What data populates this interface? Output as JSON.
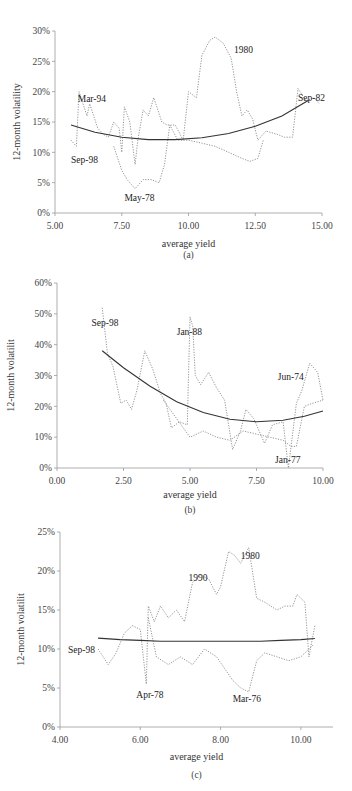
{
  "chart_data": [
    {
      "id": "a",
      "type": "line",
      "caption": "(a)",
      "title": "",
      "xlabel": "average yield",
      "ylabel": "12-month volatility",
      "xlim": [
        5.0,
        15.0
      ],
      "ylim": [
        0,
        30
      ],
      "xticks": [
        "5.00",
        "7.50",
        "10.00",
        "12.50",
        "15.00"
      ],
      "yticks": [
        "0%",
        "5%",
        "10%",
        "15%",
        "20%",
        "25%",
        "30%"
      ],
      "grid": false,
      "legend": null,
      "annotations": [
        {
          "text": "Mar-94",
          "x": 5.85,
          "y": 18.3
        },
        {
          "text": "Sep-98",
          "x": 5.6,
          "y": 8.2
        },
        {
          "text": "May-78",
          "x": 7.6,
          "y": 2.0
        },
        {
          "text": "1980",
          "x": 11.7,
          "y": 26.3
        },
        {
          "text": "Sep-82",
          "x": 14.1,
          "y": 18.5
        }
      ],
      "fitted_curve": {
        "name": "quadratic fit",
        "x": [
          5.6,
          6.5,
          7.5,
          8.5,
          9.5,
          10.5,
          11.5,
          12.5,
          13.5,
          14.5
        ],
        "y": [
          14.5,
          13.3,
          12.5,
          12.1,
          12.1,
          12.4,
          13.1,
          14.3,
          16.0,
          18.6
        ]
      },
      "series": [
        {
          "name": "observed (dotted path)",
          "x": [
            5.6,
            5.8,
            5.9,
            6.2,
            6.3,
            6.6,
            6.8,
            7.0,
            7.2,
            7.4,
            7.5,
            7.6,
            7.8,
            8.0,
            8.1,
            8.3,
            8.5,
            8.7,
            9.0,
            9.2,
            9.5,
            9.8,
            10.0,
            10.3,
            10.5,
            10.8,
            11.0,
            11.3,
            11.6,
            11.8,
            12.0,
            12.2,
            12.4,
            12.6,
            12.9,
            13.3,
            13.6,
            13.9,
            14.1,
            14.4,
            14.7,
            14.9
          ],
          "y": [
            12.0,
            11.0,
            20.0,
            16.0,
            18.0,
            14.0,
            13.0,
            12.5,
            15.0,
            14.0,
            10.0,
            17.5,
            15.0,
            8.0,
            12.0,
            17.0,
            16.0,
            19.0,
            15.0,
            14.5,
            14.5,
            12.0,
            20.0,
            19.0,
            26.0,
            28.5,
            29.0,
            28.0,
            25.5,
            20.0,
            16.0,
            17.0,
            15.5,
            12.0,
            13.5,
            13.0,
            12.5,
            12.5,
            20.5,
            18.5,
            19.0,
            18.0
          ]
        },
        {
          "name": "observed (dotted path 2)",
          "x": [
            7.2,
            7.5,
            7.7,
            8.0,
            8.3,
            8.6,
            8.9,
            9.1,
            9.3,
            9.6,
            10.0,
            10.5,
            11.0,
            11.5,
            12.0,
            12.3,
            12.6,
            12.8
          ],
          "y": [
            11.0,
            7.0,
            5.5,
            4.0,
            5.5,
            5.5,
            5.0,
            8.0,
            14.5,
            12.0,
            12.0,
            11.5,
            11.0,
            10.0,
            9.0,
            8.5,
            9.0,
            12.0
          ]
        }
      ]
    },
    {
      "id": "b",
      "type": "line",
      "caption": "(b)",
      "title": "",
      "xlabel": "average yield",
      "ylabel": "12-month volatilit",
      "xlim": [
        0.0,
        10.0
      ],
      "ylim": [
        0,
        60
      ],
      "xticks": [
        "0.00",
        "2.50",
        "5.00",
        "7.50",
        "10.00"
      ],
      "yticks": [
        "0%",
        "10%",
        "20%",
        "30%",
        "40%",
        "50%",
        "60%"
      ],
      "grid": false,
      "legend": null,
      "annotations": [
        {
          "text": "Sep-98",
          "x": 1.3,
          "y": 46.0
        },
        {
          "text": "Jan-88",
          "x": 4.5,
          "y": 43.0
        },
        {
          "text": "Jun-74",
          "x": 8.3,
          "y": 28.5
        },
        {
          "text": "Jan-77",
          "x": 8.2,
          "y": 1.5
        }
      ],
      "fitted_curve": {
        "name": "quadratic fit",
        "x": [
          1.7,
          2.5,
          3.5,
          4.5,
          5.5,
          6.5,
          7.5,
          8.5,
          9.3,
          10.0
        ],
        "y": [
          38.0,
          32.5,
          26.5,
          21.5,
          18.0,
          15.8,
          15.0,
          15.5,
          16.8,
          18.5
        ]
      },
      "series": [
        {
          "name": "observed (dotted path)",
          "x": [
            1.7,
            1.9,
            2.1,
            2.4,
            2.6,
            2.8,
            3.0,
            3.3,
            3.6,
            3.9,
            4.1,
            4.3,
            4.6,
            4.9,
            5.0,
            5.1,
            5.2,
            5.4,
            5.7,
            6.0,
            6.3,
            6.6,
            6.9,
            7.1,
            7.4,
            7.8,
            8.1,
            8.5,
            8.7,
            9.0,
            9.2,
            9.5,
            9.8,
            10.0
          ],
          "y": [
            52.0,
            37.0,
            33.0,
            21.0,
            22.0,
            19.0,
            25.0,
            38.0,
            32.0,
            24.0,
            21.0,
            13.0,
            15.0,
            14.0,
            49.0,
            46.0,
            30.0,
            27.0,
            31.0,
            26.0,
            22.0,
            6.0,
            12.0,
            19.0,
            16.0,
            8.0,
            14.0,
            15.0,
            0.0,
            21.0,
            25.0,
            34.0,
            31.0,
            22.0
          ]
        },
        {
          "name": "observed (dotted path 2)",
          "x": [
            4.0,
            4.5,
            5.0,
            5.5,
            6.0,
            6.5,
            7.0,
            7.5,
            8.0,
            8.5,
            8.8,
            9.0,
            9.3,
            9.6,
            10.0
          ],
          "y": [
            22.0,
            16.0,
            10.0,
            12.0,
            10.0,
            9.0,
            12.0,
            11.0,
            10.0,
            9.0,
            7.0,
            7.0,
            20.0,
            21.0,
            22.0
          ]
        }
      ]
    },
    {
      "id": "c",
      "type": "line",
      "caption": "(c)",
      "title": "",
      "xlabel": "average yield",
      "ylabel": "12-month volatilit",
      "xlim": [
        4.0,
        10.8
      ],
      "ylim": [
        0,
        25
      ],
      "xticks": [
        "4.00",
        "6.00",
        "8.00",
        "10.00"
      ],
      "yticks": [
        "0%",
        "5%",
        "10%",
        "15%",
        "20%",
        "25%"
      ],
      "grid": false,
      "legend": null,
      "annotations": [
        {
          "text": "Sep-98",
          "x": 4.2,
          "y": 9.5
        },
        {
          "text": "Apr-78",
          "x": 5.9,
          "y": 3.7
        },
        {
          "text": "1990",
          "x": 7.2,
          "y": 18.7
        },
        {
          "text": "1980",
          "x": 8.5,
          "y": 21.5
        },
        {
          "text": "Mar-76",
          "x": 8.3,
          "y": 3.2
        }
      ],
      "fitted_curve": {
        "name": "quadratic fit",
        "x": [
          4.95,
          5.5,
          6.0,
          6.5,
          7.0,
          7.5,
          8.0,
          8.5,
          9.0,
          9.5,
          10.0,
          10.35
        ],
        "y": [
          11.4,
          11.2,
          11.1,
          11.0,
          11.0,
          11.0,
          11.0,
          11.0,
          11.0,
          11.1,
          11.2,
          11.35
        ]
      },
      "series": [
        {
          "name": "observed (dotted path)",
          "x": [
            4.95,
            5.2,
            5.4,
            5.6,
            5.8,
            6.0,
            6.15,
            6.2,
            6.35,
            6.5,
            6.7,
            6.9,
            7.1,
            7.3,
            7.5,
            7.7,
            7.9,
            8.0,
            8.2,
            8.35,
            8.5,
            8.7,
            8.9,
            9.1,
            9.4,
            9.6,
            9.8,
            9.9,
            10.1,
            10.2,
            10.35
          ],
          "y": [
            10.0,
            8.0,
            9.5,
            12.0,
            13.0,
            12.5,
            5.5,
            15.5,
            13.5,
            15.5,
            14.0,
            15.0,
            13.5,
            18.5,
            19.5,
            19.0,
            17.0,
            18.0,
            22.5,
            22.0,
            21.0,
            23.0,
            16.5,
            16.0,
            15.0,
            15.5,
            15.5,
            17.0,
            16.0,
            9.0,
            13.0
          ]
        },
        {
          "name": "observed (dotted path 2)",
          "x": [
            6.2,
            6.4,
            6.7,
            7.0,
            7.3,
            7.6,
            7.9,
            8.1,
            8.3,
            8.5,
            8.7,
            8.9,
            9.1,
            9.4,
            9.7,
            10.0,
            10.3
          ],
          "y": [
            14.0,
            9.0,
            8.0,
            9.0,
            8.0,
            10.0,
            9.0,
            7.5,
            6.0,
            5.0,
            4.5,
            8.5,
            9.5,
            9.0,
            8.5,
            9.0,
            10.5
          ]
        }
      ]
    }
  ]
}
